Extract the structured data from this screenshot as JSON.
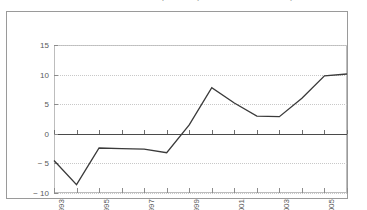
{
  "chart_data": {
    "type": "line",
    "title": "Tabela 3 — Resultado primário (1993-2006 — % do PIB)",
    "xlabel": "",
    "ylabel": "",
    "x": [
      1993,
      1994,
      1995,
      1996,
      1997,
      1998,
      1999,
      2000,
      2001,
      2002,
      2003,
      2004,
      2005,
      2006
    ],
    "values": [
      -4.5,
      -8.6,
      -2.4,
      -2.5,
      -2.6,
      -3.2,
      1.5,
      7.8,
      5.2,
      3.0,
      2.9,
      6.0,
      9.8,
      10.1
    ],
    "series": [
      {
        "name": "Resultado",
        "values": [
          -4.5,
          -8.6,
          -2.4,
          -2.5,
          -2.6,
          -3.2,
          1.5,
          7.8,
          5.2,
          3.0,
          2.9,
          6.0,
          9.8,
          10.1
        ]
      }
    ],
    "ylim": [
      -10,
      15
    ],
    "xlim": [
      1993,
      2006
    ],
    "yticks": [
      15,
      10,
      5,
      0,
      -5,
      -10
    ],
    "ytick_labels": [
      "15",
      "10",
      "5",
      "0",
      "− 5",
      "− 10"
    ],
    "xticks": [
      1993,
      1994,
      1995,
      1996,
      1997,
      1998,
      1999,
      2000,
      2001,
      2002,
      2003,
      2004,
      2005,
      2006
    ],
    "xtick_labels": [
      "1993",
      "",
      "1995",
      "",
      "1997",
      "",
      "1999",
      "",
      "2001",
      "",
      "2003",
      "",
      "2005",
      ""
    ],
    "grid": true,
    "grid_style": "dotted-horizontal",
    "legend": false,
    "legend_position": "none",
    "line_color": "#3a3a3a",
    "grid_color": "#c8c8c8",
    "axis_color": "#4a4a4a",
    "frame_color": "#9a9a9a",
    "background": "#ffffff"
  }
}
